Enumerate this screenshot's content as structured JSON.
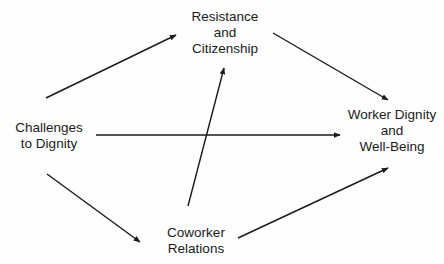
{
  "diagram": {
    "type": "path-model",
    "colors": {
      "background": "#ffffff",
      "line": "#1a1a1a",
      "text": "#1a1a1a"
    },
    "nodes": {
      "resistance": {
        "lines": [
          "Resistance",
          "and",
          "Citizenship"
        ]
      },
      "challenges": {
        "lines": [
          "Challenges",
          "to Dignity"
        ]
      },
      "worker": {
        "lines": [
          "Worker Dignity",
          "and",
          "Well-Being"
        ]
      },
      "coworker": {
        "lines": [
          "Coworker",
          "Relations"
        ]
      }
    },
    "edges": [
      {
        "from": "Challenges to Dignity",
        "to": "Resistance and Citizenship",
        "x1": 46,
        "y1": 98,
        "x2": 176,
        "y2": 35
      },
      {
        "from": "Resistance and Citizenship",
        "to": "Worker Dignity and Well-Being",
        "x1": 273,
        "y1": 33,
        "x2": 388,
        "y2": 100
      },
      {
        "from": "Challenges to Dignity",
        "to": "Worker Dignity and Well-Being",
        "x1": 96,
        "y1": 135,
        "x2": 340,
        "y2": 135
      },
      {
        "from": "Challenges to Dignity",
        "to": "Coworker Relations",
        "x1": 47,
        "y1": 174,
        "x2": 140,
        "y2": 242
      },
      {
        "from": "Coworker Relations",
        "to": "Worker Dignity and Well-Being",
        "x1": 238,
        "y1": 238,
        "x2": 388,
        "y2": 168
      },
      {
        "from": "Coworker Relations",
        "to": "Resistance and Citizenship",
        "x1": 188,
        "y1": 206,
        "x2": 224,
        "y2": 68
      }
    ]
  }
}
